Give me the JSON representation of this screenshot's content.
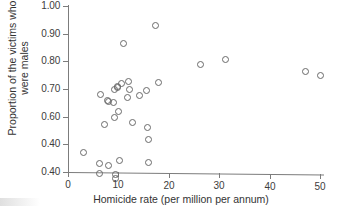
{
  "chart_data": {
    "type": "scatter",
    "title": "",
    "xlabel": "Homicide rate (per million per annum)",
    "ylabel_lines": [
      "Proportion of the victims who",
      "were males"
    ],
    "ylabel": "Proportion of the victims who were males",
    "xlim": [
      0,
      50
    ],
    "ylim": [
      0.4,
      1.0
    ],
    "xticks": [
      0,
      10,
      20,
      30,
      40,
      50
    ],
    "xtick_labels": [
      "0",
      "10",
      "20",
      "30",
      "40",
      "50"
    ],
    "yticks": [
      0.4,
      0.5,
      0.6,
      0.7,
      0.8,
      0.9,
      1.0
    ],
    "ytick_labels": [
      "0.40",
      "0.40",
      "0.60",
      "0.70",
      "0.80",
      "0.90",
      "1.00"
    ],
    "ytick_label_note": "As printed in the scanned figure the second-from-bottom tick reads 0.40 (a duplicate of the bottom label).",
    "grid": false,
    "legend": null,
    "marker": "open-circle",
    "marker_color": "#6a6a6a",
    "n_points": 37,
    "points": [
      {
        "x": 3.1,
        "y": 0.47
      },
      {
        "x": 6.2,
        "y": 0.395
      },
      {
        "x": 6.3,
        "y": 0.43
      },
      {
        "x": 6.5,
        "y": 0.68
      },
      {
        "x": 7.2,
        "y": 0.57
      },
      {
        "x": 7.8,
        "y": 0.66
      },
      {
        "x": 8.0,
        "y": 0.655
      },
      {
        "x": 8.1,
        "y": 0.425
      },
      {
        "x": 9.0,
        "y": 0.65
      },
      {
        "x": 9.2,
        "y": 0.7
      },
      {
        "x": 9.3,
        "y": 0.598
      },
      {
        "x": 9.4,
        "y": 0.39
      },
      {
        "x": 9.4,
        "y": 0.375
      },
      {
        "x": 9.8,
        "y": 0.71
      },
      {
        "x": 9.9,
        "y": 0.705
      },
      {
        "x": 10.0,
        "y": 0.617
      },
      {
        "x": 10.3,
        "y": 0.443
      },
      {
        "x": 10.6,
        "y": 0.72
      },
      {
        "x": 11.1,
        "y": 0.865
      },
      {
        "x": 11.8,
        "y": 0.67
      },
      {
        "x": 12.1,
        "y": 0.727
      },
      {
        "x": 12.3,
        "y": 0.699
      },
      {
        "x": 12.8,
        "y": 0.58
      },
      {
        "x": 14.2,
        "y": 0.677
      },
      {
        "x": 15.6,
        "y": 0.694
      },
      {
        "x": 15.8,
        "y": 0.56
      },
      {
        "x": 15.9,
        "y": 0.518
      },
      {
        "x": 16.0,
        "y": 0.435
      },
      {
        "x": 17.4,
        "y": 0.928
      },
      {
        "x": 18.0,
        "y": 0.722
      },
      {
        "x": 26.3,
        "y": 0.787
      },
      {
        "x": 31.2,
        "y": 0.808
      },
      {
        "x": 47.2,
        "y": 0.762
      },
      {
        "x": 50.0,
        "y": 0.748
      }
    ]
  },
  "axis_title_x": "Homicide rate (per million per annum)",
  "axis_title_y_line1": "Proportion of the victims who",
  "axis_title_y_line2": "were males"
}
